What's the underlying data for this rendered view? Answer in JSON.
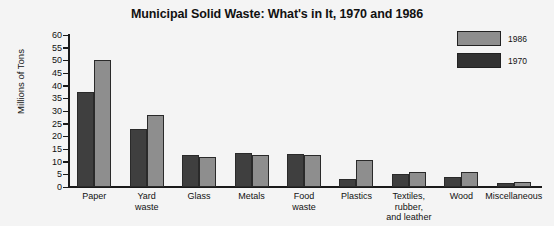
{
  "chart_data": {
    "type": "bar",
    "title": "Municipal Solid Waste: What's in It, 1970 and 1986",
    "xlabel": "",
    "ylabel": "Millions of Tons",
    "ylim": [
      0,
      60
    ],
    "ytick_step": 5,
    "yticks": [
      "60",
      "55",
      "50",
      "45",
      "40",
      "35",
      "30",
      "25",
      "20",
      "15",
      "10",
      "5",
      "0"
    ],
    "grid": false,
    "legend_position": "top-right",
    "categories": [
      "Paper",
      "Yard waste",
      "Glass",
      "Metals",
      "Food waste",
      "Plastics",
      "Textiles, rubber, and leather",
      "Wood",
      "Miscellaneous"
    ],
    "category_lines": [
      [
        "Paper"
      ],
      [
        "Yard",
        "waste"
      ],
      [
        "Glass"
      ],
      [
        "Metals"
      ],
      [
        "Food",
        "waste"
      ],
      [
        "Plastics"
      ],
      [
        "Textiles,",
        "rubber,",
        "and leather"
      ],
      [
        "Wood"
      ],
      [
        "Miscellaneous"
      ]
    ],
    "series": [
      {
        "name": "1970",
        "color": "#3f3f3f",
        "values": [
          37.5,
          23,
          12.5,
          13.5,
          13,
          3,
          5,
          4,
          1.5
        ]
      },
      {
        "name": "1986",
        "color": "#8e8e8e",
        "values": [
          50,
          28.5,
          12,
          12.8,
          12.5,
          10.5,
          6,
          6,
          2
        ]
      }
    ]
  },
  "legend": {
    "entries": [
      {
        "label": "1986",
        "series": "1986"
      },
      {
        "label": "1970",
        "series": "1970"
      }
    ]
  }
}
